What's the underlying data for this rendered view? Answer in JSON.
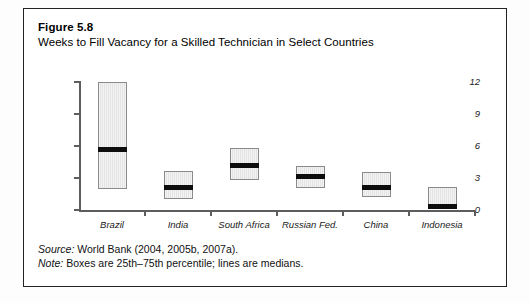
{
  "figure": {
    "number": "Figure 5.8",
    "title": "Weeks to Fill Vacancy for a Skilled Technician in Select Countries",
    "source_label": "Source:",
    "source_text": " World Bank (2004, 2005b, 2007a).",
    "note_label": "Note:",
    "note_text": " Boxes are 25th–75th percentile; lines are medians."
  },
  "colors": {
    "frame_border": "#232323",
    "axis": "#5d5d5d",
    "box_fill": "#e4e4e4",
    "box_border": "#8a8a8a",
    "median_line": "#0d0d0d",
    "text": "#111111"
  },
  "chart_data": {
    "type": "box",
    "title": "Weeks to Fill Vacancy for a Skilled Technician in Select Countries",
    "xlabel": "",
    "ylabel": "",
    "ylim": [
      0,
      12
    ],
    "yticks": [
      0,
      3,
      6,
      9,
      12
    ],
    "ytick_labels": [
      "0",
      "3",
      "6",
      "9",
      "12"
    ],
    "grid": false,
    "legend": "none",
    "categories": [
      "Brazil",
      "India",
      "South Africa",
      "Russian Fed.",
      "China",
      "Indonesia"
    ],
    "boxes": [
      {
        "category": "Brazil",
        "q1": 2.0,
        "q3": 12.0,
        "median": 5.7
      },
      {
        "category": "India",
        "q1": 1.0,
        "q3": 3.7,
        "median": 2.1
      },
      {
        "category": "South Africa",
        "q1": 2.8,
        "q3": 5.8,
        "median": 4.2
      },
      {
        "category": "Russian Fed.",
        "q1": 2.1,
        "q3": 4.1,
        "median": 3.1
      },
      {
        "category": "China",
        "q1": 1.2,
        "q3": 3.6,
        "median": 2.1
      },
      {
        "category": "Indonesia",
        "q1": 0.15,
        "q3": 2.2,
        "median": 0.35
      }
    ]
  }
}
